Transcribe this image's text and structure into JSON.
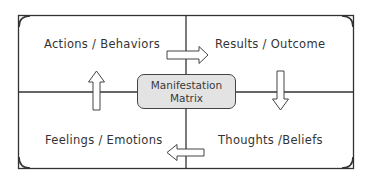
{
  "diagram": {
    "title": "Manifestation Matrix",
    "center": {
      "line1": "Manifestation",
      "line2": "Matrix"
    },
    "quadrants": {
      "top_left": "Actions / Behaviors",
      "top_right": "Results / Outcome",
      "bottom_right": "Thoughts /Beliefs",
      "bottom_left": "Feelings / Emotions"
    },
    "flow": [
      {
        "from": "Actions / Behaviors",
        "to": "Results / Outcome",
        "direction": "right"
      },
      {
        "from": "Results / Outcome",
        "to": "Thoughts /Beliefs",
        "direction": "down"
      },
      {
        "from": "Thoughts /Beliefs",
        "to": "Feelings / Emotions",
        "direction": "left"
      },
      {
        "from": "Feelings / Emotions",
        "to": "Actions / Behaviors",
        "direction": "up"
      }
    ],
    "colors": {
      "line": "#333333",
      "center_fill": "#e3e3e3",
      "text": "#333333"
    }
  }
}
